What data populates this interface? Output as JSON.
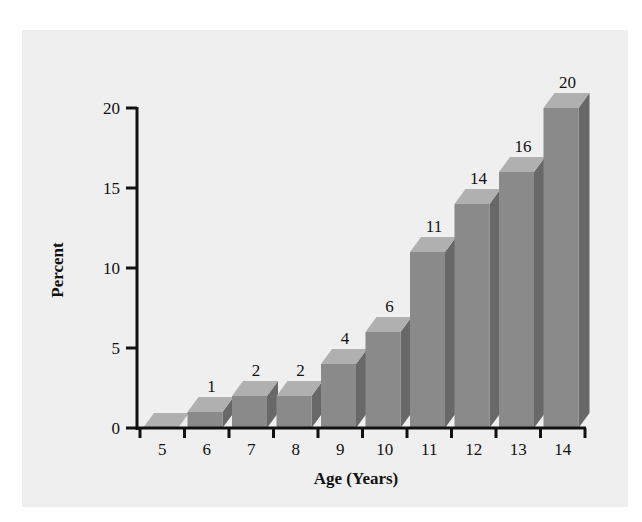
{
  "chart_data": {
    "type": "bar",
    "style": "3d",
    "title": "",
    "xlabel": "Age (Years)",
    "ylabel": "Percent",
    "categories": [
      "5",
      "6",
      "7",
      "8",
      "9",
      "10",
      "11",
      "12",
      "13",
      "14"
    ],
    "values": [
      0,
      1,
      2,
      2,
      4,
      6,
      11,
      14,
      16,
      20
    ],
    "value_labels": [
      "",
      "1",
      "2",
      "2",
      "4",
      "6",
      "11",
      "14",
      "16",
      "20"
    ],
    "ylim": [
      0,
      20
    ],
    "yticks": [
      0,
      5,
      10,
      15,
      20
    ],
    "grid": false,
    "legend": null
  },
  "colors": {
    "background": "#efefef",
    "bar_front": "#8a8a8a",
    "bar_top": "#b0b0b0",
    "bar_side": "#686868",
    "axis": "#111111"
  },
  "caption_partial": ""
}
